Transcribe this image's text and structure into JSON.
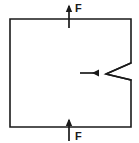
{
  "figure": {
    "kind": "engineering-fracture-mechanics-diagram",
    "background_color": "#ffffff",
    "line_color": "#1a1a1a"
  },
  "specimen": {
    "name": "rectangular plate",
    "left": 10,
    "top": 19,
    "right": 131,
    "bottom": 127,
    "stroke_width": 1.6
  },
  "notch": {
    "name": "edge notch",
    "side": "right",
    "tip_x": 106,
    "tip_y": 74,
    "mouth_top_y": 63,
    "mouth_bottom_y": 80,
    "mouth_x": 131,
    "stroke_width": 1.4
  },
  "notch_pointer": {
    "name": "notch indicator arrow",
    "direction": "left",
    "tail_x": 80,
    "head_x": 101,
    "y": 73,
    "stroke_width": 1.6,
    "head_size": 4
  },
  "loads": [
    {
      "id": "top",
      "label": "F",
      "direction": "up",
      "x": 69,
      "tail_y": 28,
      "head_y": 5,
      "label_x": 76,
      "label_y": 11
    },
    {
      "id": "bottom",
      "label": "F",
      "direction": "up",
      "x": 69,
      "tail_y": 141,
      "head_y": 118,
      "label_x": 76,
      "label_y": 140
    }
  ]
}
